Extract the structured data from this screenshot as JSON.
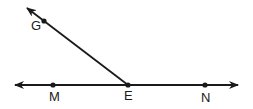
{
  "diagram": {
    "type": "geometry-angle",
    "line": {
      "name": "MN",
      "points": [
        "M",
        "E",
        "N"
      ],
      "bidirectional": true
    },
    "ray": {
      "name": "EG",
      "from": "E",
      "through": "G"
    },
    "points": [
      {
        "label": "G",
        "x": 44,
        "y": 21
      },
      {
        "label": "M",
        "x": 53,
        "y": 85
      },
      {
        "label": "E",
        "x": 128,
        "y": 85
      },
      {
        "label": "N",
        "x": 205,
        "y": 85
      }
    ],
    "labels": {
      "G": "G",
      "M": "M",
      "E": "E",
      "N": "N"
    },
    "colors": {
      "stroke": "#1a1a1a",
      "background": "#ffffff"
    }
  }
}
